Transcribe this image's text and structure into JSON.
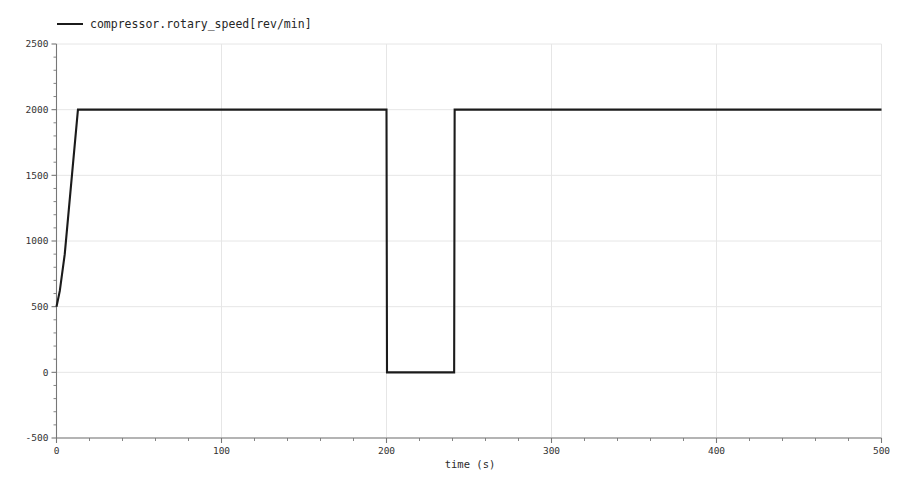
{
  "chart_data": {
    "type": "line",
    "title": "",
    "xlabel": "time (s)",
    "ylabel": "",
    "xlim": [
      0,
      500
    ],
    "ylim": [
      -500,
      2500
    ],
    "grid": true,
    "legend_position": "top-left",
    "xticks": [
      0,
      100,
      200,
      300,
      400,
      500
    ],
    "xtick_labels": [
      "0",
      "100",
      "200",
      "300",
      "400",
      "500"
    ],
    "yticks": [
      -500,
      0,
      500,
      1000,
      1500,
      2000,
      2500
    ],
    "ytick_labels": [
      "-500",
      "0",
      "500",
      "1000",
      "1500",
      "2000",
      "2500"
    ],
    "minor_tick_count": 5,
    "series": [
      {
        "name": "compressor.rotary_speed[rev/min]",
        "color": "#1b1b1b",
        "x": [
          0,
          2,
          5,
          13,
          200,
          200.3,
          241,
          241.3,
          500
        ],
        "values": [
          500,
          620,
          900,
          2000,
          2000,
          0,
          0,
          2000,
          2000
        ]
      }
    ],
    "annotations": []
  },
  "legend": {
    "entries": [
      {
        "label": "compressor.rotary_speed[rev/min]",
        "color": "#1b1b1b"
      }
    ]
  },
  "axes": {
    "x_label": "time (s)",
    "x_tick_labels": [
      "0",
      "100",
      "200",
      "300",
      "400",
      "500"
    ],
    "y_tick_labels": [
      "2500",
      "2000",
      "1500",
      "1000",
      "500",
      "0",
      "-500"
    ]
  },
  "colors": {
    "series": "#1b1b1b",
    "grid": "#e6e6e6",
    "axis": "#777777",
    "background": "#ffffff"
  }
}
